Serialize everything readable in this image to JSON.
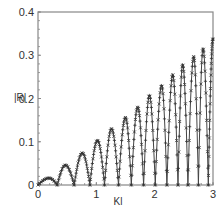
{
  "chart_data": {
    "type": "line",
    "title": "",
    "xlabel": "Kl",
    "ylabel": "|R|",
    "xlim": [
      0,
      3
    ],
    "ylim": [
      0,
      0.4
    ],
    "xticks": [
      0,
      1,
      2,
      3
    ],
    "xtick_labels": [
      "0",
      "1",
      "2",
      "3"
    ],
    "yticks": [
      0,
      0.1,
      0.2,
      0.3,
      0.4
    ],
    "ytick_labels": [
      "0",
      "0.1",
      "0.2",
      "0.3",
      "0.4"
    ],
    "grid": false,
    "legend": null,
    "series": [
      {
        "name": "curve (solid line)",
        "style": "line",
        "peaks": {
          "x": [
            0.19,
            0.47,
            0.76,
            1.02,
            1.26,
            1.5,
            1.71,
            1.91,
            2.12,
            2.31,
            2.48,
            2.67,
            2.83,
            3.0
          ],
          "y": [
            0.016,
            0.046,
            0.074,
            0.103,
            0.13,
            0.156,
            0.18,
            0.207,
            0.23,
            0.255,
            0.278,
            0.297,
            0.315,
            0.338
          ]
        },
        "zeros_x": [
          0.0,
          0.33,
          0.62,
          0.89,
          1.14,
          1.38,
          1.6,
          1.81,
          2.01,
          2.21,
          2.4,
          2.57,
          2.75,
          2.92
        ]
      },
      {
        "name": "markers x",
        "style": "x-marker"
      },
      {
        "name": "markers +",
        "style": "plus-marker"
      }
    ]
  },
  "colors": {
    "axis": "#888888",
    "curve": "#444444",
    "markers": "#333333",
    "text": "#333333"
  }
}
